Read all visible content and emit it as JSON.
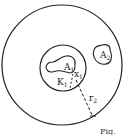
{
  "figure": {
    "labels": {
      "A1": {
        "main": "A",
        "sub": "1"
      },
      "A2": {
        "main": "A",
        "sub": "2"
      },
      "K1": {
        "main": "K",
        "sub": "1"
      },
      "x": {
        "main": "x",
        "sub": "1"
      },
      "r2": {
        "main": "r",
        "sub": "2"
      }
    },
    "caption_partial": "Fig."
  }
}
